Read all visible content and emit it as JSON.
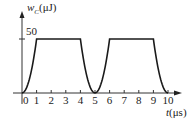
{
  "chart_data": {
    "type": "line",
    "title": "",
    "ylabel": "w_C(μJ)",
    "ylabel_main": "w",
    "ylabel_sub": "C",
    "ylabel_unit": "(μJ)",
    "xlabel": "t(μs)",
    "xlabel_main": "t",
    "xlabel_unit": "(μs)",
    "x_ticks": [
      "0",
      "1",
      "2",
      "3",
      "4",
      "5",
      "6",
      "7",
      "8",
      "9",
      "10"
    ],
    "y_ticks": [
      "50"
    ],
    "xlim": [
      0,
      10.5
    ],
    "ylim": [
      0,
      60
    ],
    "grid": false,
    "legend": null,
    "series": [
      {
        "name": "w_C",
        "x": [
          0,
          0.25,
          0.5,
          0.75,
          1,
          2,
          3,
          4,
          4.25,
          4.5,
          4.75,
          5,
          5.25,
          5.5,
          5.75,
          6,
          7,
          8,
          9,
          9.25,
          9.5,
          9.75,
          10
        ],
        "values": [
          0,
          3.1,
          12.5,
          28.1,
          50,
          50,
          50,
          50,
          28.1,
          12.5,
          3.1,
          0,
          3.1,
          12.5,
          28.1,
          50,
          50,
          50,
          50,
          28.1,
          12.5,
          3.1,
          0
        ]
      }
    ],
    "annotations": []
  }
}
